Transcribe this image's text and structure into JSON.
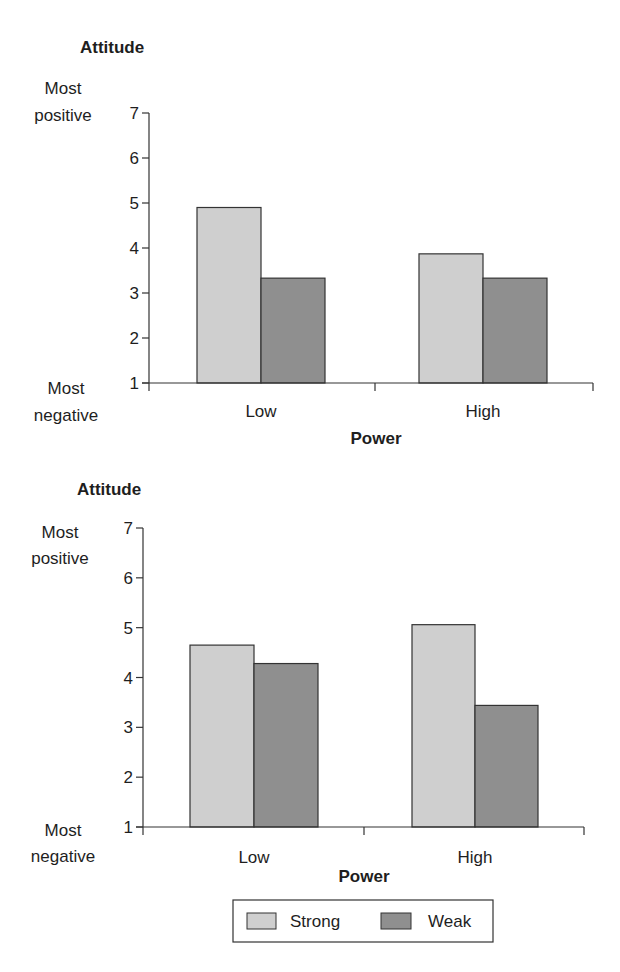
{
  "chart_data": [
    {
      "type": "bar",
      "title": "Attitude",
      "xlabel": "Power",
      "ylabel": "Attitude",
      "y_top_anchor": [
        "Most",
        "positive"
      ],
      "y_bottom_anchor": [
        "Most",
        "negative"
      ],
      "categories": [
        "Low",
        "High"
      ],
      "yticks": [
        1,
        2,
        3,
        4,
        5,
        6,
        7
      ],
      "ylim": [
        1,
        7
      ],
      "grid": false,
      "series": [
        {
          "name": "Strong",
          "color": "#cfcfcf",
          "values": [
            4.9,
            3.87
          ]
        },
        {
          "name": "Weak",
          "color": "#8f8f8f",
          "values": [
            3.33,
            3.33
          ]
        }
      ]
    },
    {
      "type": "bar",
      "title": "Attitude",
      "xlabel": "Power",
      "ylabel": "Attitude",
      "y_top_anchor": [
        "Most",
        "positive"
      ],
      "y_bottom_anchor": [
        "Most",
        "negative"
      ],
      "categories": [
        "Low",
        "High"
      ],
      "yticks": [
        1,
        2,
        3,
        4,
        5,
        6,
        7
      ],
      "ylim": [
        1,
        7
      ],
      "grid": false,
      "series": [
        {
          "name": "Strong",
          "color": "#cfcfcf",
          "values": [
            4.65,
            5.06
          ]
        },
        {
          "name": "Weak",
          "color": "#8f8f8f",
          "values": [
            4.28,
            3.44
          ]
        }
      ]
    }
  ],
  "legend": {
    "position": "bottom-center",
    "items": [
      {
        "label": "Strong",
        "color": "#cfcfcf"
      },
      {
        "label": "Weak",
        "color": "#8f8f8f"
      }
    ]
  }
}
